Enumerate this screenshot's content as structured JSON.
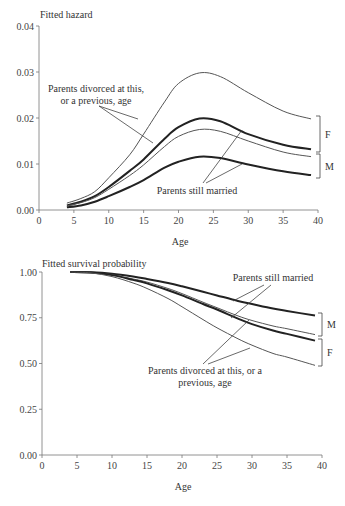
{
  "chart_data": [
    {
      "type": "line",
      "title": "Fitted hazard",
      "xlabel": "Age",
      "ylabel": "Fitted hazard",
      "xlim": [
        0,
        40
      ],
      "ylim": [
        0,
        0.04
      ],
      "xticks": [
        "0",
        "5",
        "10",
        "15",
        "20",
        "25",
        "30",
        "35",
        "40"
      ],
      "yticks": [
        "0.00",
        "0.01",
        "0.02",
        "0.03",
        "0.04"
      ],
      "grid": false,
      "x": [
        4,
        6,
        8,
        10,
        13,
        15,
        18,
        20,
        23,
        26,
        30,
        35,
        39
      ],
      "series": [
        {
          "name": "F – Parents divorced at this, or a previous, age",
          "style": "thin",
          "values": [
            0.0015,
            0.0025,
            0.004,
            0.007,
            0.012,
            0.0165,
            0.0235,
            0.0275,
            0.0298,
            0.029,
            0.0255,
            0.0215,
            0.0198
          ]
        },
        {
          "name": "F – Parents still married",
          "style": "thick",
          "values": [
            0.001,
            0.0018,
            0.003,
            0.005,
            0.0085,
            0.011,
            0.0155,
            0.018,
            0.0199,
            0.0193,
            0.0165,
            0.0142,
            0.0132
          ]
        },
        {
          "name": "M – Parents divorced at this, or a previous, age",
          "style": "thin",
          "values": [
            0.0009,
            0.0016,
            0.0027,
            0.0045,
            0.0075,
            0.0098,
            0.0138,
            0.016,
            0.0175,
            0.0171,
            0.015,
            0.0126,
            0.0116
          ]
        },
        {
          "name": "M – Parents still married",
          "style": "thick",
          "values": [
            0.0006,
            0.001,
            0.0018,
            0.003,
            0.005,
            0.0065,
            0.0092,
            0.0105,
            0.0116,
            0.0113,
            0.0099,
            0.0084,
            0.0076
          ]
        }
      ],
      "annotations": [
        {
          "text_lines": [
            "Parents divorced at this,",
            "or a previous, age"
          ]
        },
        {
          "text_lines": [
            "Parents still married"
          ]
        }
      ],
      "brackets": [
        {
          "label": "F"
        },
        {
          "label": "M"
        }
      ]
    },
    {
      "type": "line",
      "title": "Fitted survival probability",
      "xlabel": "Age",
      "ylabel": "Fitted survival probability",
      "xlim": [
        0,
        40
      ],
      "ylim": [
        0,
        1
      ],
      "xticks": [
        "0",
        "5",
        "10",
        "15",
        "20",
        "25",
        "30",
        "35",
        "40"
      ],
      "yticks": [
        "0.00",
        "0.25",
        "0.50",
        "0.75",
        "1.00"
      ],
      "grid": false,
      "x": [
        4,
        7,
        10,
        13,
        15,
        18,
        20,
        23,
        25,
        28,
        30,
        33,
        35,
        39
      ],
      "series": [
        {
          "name": "M – Parents still married",
          "style": "thick",
          "values": [
            1.0,
            0.998,
            0.99,
            0.975,
            0.962,
            0.94,
            0.922,
            0.892,
            0.872,
            0.842,
            0.825,
            0.8,
            0.787,
            0.762
          ]
        },
        {
          "name": "M – Parents divorced at this, or a previous, age",
          "style": "thin",
          "values": [
            1.0,
            0.997,
            0.985,
            0.962,
            0.945,
            0.91,
            0.882,
            0.835,
            0.805,
            0.76,
            0.735,
            0.705,
            0.69,
            0.658
          ]
        },
        {
          "name": "F – Parents still married",
          "style": "thick",
          "values": [
            1.0,
            0.997,
            0.983,
            0.957,
            0.938,
            0.9,
            0.872,
            0.825,
            0.795,
            0.745,
            0.715,
            0.68,
            0.662,
            0.625
          ]
        },
        {
          "name": "F – Parents divorced at this, or a previous, age",
          "style": "thin",
          "values": [
            1.0,
            0.995,
            0.975,
            0.94,
            0.91,
            0.855,
            0.81,
            0.74,
            0.695,
            0.635,
            0.6,
            0.555,
            0.535,
            0.49
          ]
        }
      ],
      "annotations": [
        {
          "text_lines": [
            "Parents still married"
          ]
        },
        {
          "text_lines": [
            "Parents divorced at this, or a",
            "previous, age"
          ]
        }
      ],
      "brackets": [
        {
          "label": "M"
        },
        {
          "label": "F"
        }
      ]
    }
  ]
}
